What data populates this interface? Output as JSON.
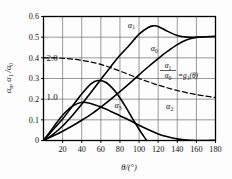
{
  "chart_data": {
    "type": "line",
    "title": "",
    "xlabel": "θ/(°)",
    "ylabel": "αn, α1/α0",
    "xlim": [
      0,
      180
    ],
    "ylim": [
      0,
      0.6
    ],
    "grid": true,
    "xticks": [
      0,
      20,
      40,
      60,
      80,
      100,
      120,
      140,
      160,
      180
    ],
    "xticklabels": [
      "",
      "20",
      "40",
      "60",
      "80",
      "100",
      "120",
      "140",
      "160",
      "180"
    ],
    "yticks": [
      0,
      0.1,
      0.2,
      0.3,
      0.4,
      0.5,
      0.6
    ],
    "yticklabels": [
      "0",
      "0.1",
      "0.2",
      "0.3",
      "0.4",
      "0.5",
      "0.6"
    ],
    "secondary_axis_labels": [
      {
        "text": "2.0",
        "y_value": 0.4
      },
      {
        "text": "1.0",
        "y_value": 0.21
      }
    ],
    "legend_position": "inline-curve-labels",
    "annotations": [
      {
        "text": "α1/α0 = g1(θ)",
        "x_value": 136,
        "y_value": 0.285
      }
    ],
    "series": [
      {
        "name": "α1",
        "label": "α₁",
        "style": "solid",
        "label_x_value": 92,
        "label_y_value": 0.545,
        "x": [
          0,
          10,
          20,
          30,
          40,
          50,
          60,
          70,
          80,
          90,
          100,
          110,
          115,
          120,
          130,
          140,
          150,
          160,
          170,
          180
        ],
        "y": [
          0.0,
          0.03,
          0.07,
          0.12,
          0.175,
          0.235,
          0.295,
          0.355,
          0.412,
          0.462,
          0.515,
          0.548,
          0.555,
          0.552,
          0.528,
          0.508,
          0.5,
          0.5,
          0.502,
          0.503
        ]
      },
      {
        "name": "α0",
        "label": "α₀",
        "style": "solid",
        "label_x_value": 116,
        "label_y_value": 0.432,
        "x": [
          0,
          10,
          20,
          30,
          40,
          50,
          60,
          70,
          80,
          90,
          100,
          110,
          120,
          130,
          140,
          150,
          160,
          170,
          180
        ],
        "y": [
          0.0,
          0.022,
          0.045,
          0.07,
          0.098,
          0.128,
          0.162,
          0.198,
          0.236,
          0.276,
          0.318,
          0.358,
          0.396,
          0.432,
          0.464,
          0.487,
          0.498,
          0.502,
          0.503
        ]
      },
      {
        "name": "α3",
        "label": "α₃",
        "style": "solid",
        "label_x_value": 78,
        "label_y_value": 0.155,
        "x": [
          0,
          10,
          20,
          30,
          40,
          50,
          57,
          65,
          75,
          85,
          95,
          105,
          115,
          125,
          135,
          145,
          155,
          165,
          175,
          180
        ],
        "y": [
          0.0,
          0.052,
          0.104,
          0.165,
          0.225,
          0.275,
          0.29,
          0.282,
          0.238,
          0.17,
          0.092,
          0.02,
          -0.038,
          -0.048,
          -0.04,
          -0.028,
          -0.015,
          -0.005,
          0.0,
          0.0
        ]
      },
      {
        "name": "α2",
        "label": "α₂",
        "style": "solid",
        "label_x_value": 132,
        "label_y_value": 0.152,
        "x": [
          0,
          10,
          20,
          30,
          40,
          50,
          60,
          70,
          80,
          90,
          100,
          110,
          120,
          130,
          140,
          150,
          160,
          170,
          180
        ],
        "y": [
          0.0,
          0.062,
          0.122,
          0.165,
          0.185,
          0.178,
          0.162,
          0.142,
          0.12,
          0.098,
          0.074,
          0.052,
          0.032,
          0.018,
          0.008,
          0.002,
          0.0,
          0.0,
          0.0
        ]
      },
      {
        "name": "g1",
        "label": "α₁/α₀ = g₁(θ)",
        "style": "dashed",
        "x": [
          0,
          20,
          40,
          60,
          80,
          100,
          120,
          140,
          160,
          180
        ],
        "y": [
          0.4,
          0.398,
          0.388,
          0.368,
          0.336,
          0.3,
          0.268,
          0.242,
          0.222,
          0.208
        ]
      }
    ]
  },
  "axis": {
    "x_label": "θ/(°)",
    "y_label_parts": {
      "alpha_n": "αn",
      "alpha_ratio": "α1/α0"
    }
  },
  "annotation": {
    "numerator": "α1",
    "denominator": "α0",
    "equals": "=g1(θ)"
  },
  "colors": {
    "curve": "#000000",
    "grid": "#6e6e6e",
    "frame": "#000000",
    "background": "#fdfdfd",
    "text": "#111111"
  }
}
